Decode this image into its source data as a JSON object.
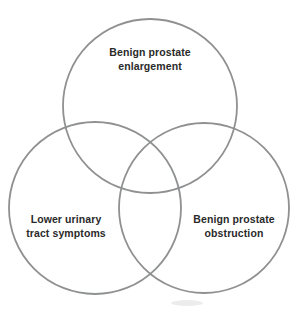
{
  "page": {
    "background": "#ffffff"
  },
  "diagram": {
    "type": "venn-3-circle",
    "circle_stroke_color": "#8f9091",
    "label_text_color": "#2a2a2a",
    "sets": [
      {
        "id": "benign-prostate-enlargement",
        "position": "top",
        "label": "Benign prostate enlargement",
        "line1": "Benign prostate",
        "line2": "enlargement"
      },
      {
        "id": "lower-urinary-tract-symptoms",
        "position": "bottom-left",
        "label": "Lower urinary tract symptoms",
        "line1": "Lower urinary",
        "line2": "tract symptoms"
      },
      {
        "id": "benign-prostate-obstruction",
        "position": "bottom-right",
        "label": "Benign prostate obstruction",
        "line1": "Benign prostate",
        "line2": "obstruction"
      }
    ]
  }
}
